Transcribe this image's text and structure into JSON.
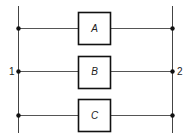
{
  "diagram": {
    "type": "parallel-circuit",
    "colors": {
      "line": "#555555",
      "box_border": "#111111",
      "node": "#111111",
      "background": "#ffffff"
    },
    "terminals": [
      {
        "label": "1",
        "side": "left"
      },
      {
        "label": "2",
        "side": "right"
      }
    ],
    "branches": [
      {
        "label": "A"
      },
      {
        "label": "B"
      },
      {
        "label": "C"
      }
    ]
  }
}
